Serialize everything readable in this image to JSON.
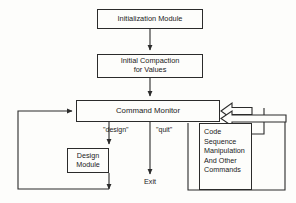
{
  "diagram": {
    "stroke_color": "#2b2b2b",
    "background_color": "#fdfdfb",
    "text_color": "#1a1a1a",
    "nodes": {
      "initialization": {
        "label": "Initialization Module"
      },
      "compaction": {
        "label": "Initial Compaction\nfor Values"
      },
      "command_monitor": {
        "label": "Command Monitor"
      },
      "design": {
        "label": "Design\nModule"
      },
      "code": {
        "label": "Code\nSequence\nManipulation\nAnd Other\nCommands"
      }
    },
    "edge_labels": {
      "design_branch": "\"design\"",
      "quit_branch": "\"quit\"",
      "exit_terminal": "Exit"
    }
  }
}
